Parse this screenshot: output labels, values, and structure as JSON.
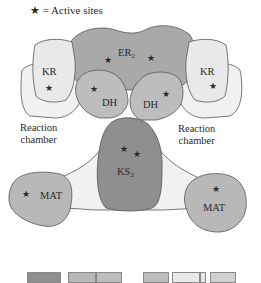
{
  "legend": {
    "symbol": "★",
    "text": "= Active sites"
  },
  "domains": {
    "er": {
      "name": "ER",
      "sub": "2",
      "color": "#a9a9a9"
    },
    "kr_left": {
      "name": "KR",
      "color": "#e9e9e9"
    },
    "kr_right": {
      "name": "KR",
      "color": "#e9e9e9"
    },
    "dh_left": {
      "name": "DH",
      "color": "#bdbdbd"
    },
    "dh_right": {
      "name": "DH",
      "color": "#bdbdbd"
    },
    "ks": {
      "name": "KS",
      "sub": "2",
      "color": "#8f8f8f"
    },
    "mat_left": {
      "name": "MAT",
      "color": "#b8b8b8"
    },
    "mat_right": {
      "name": "MAT",
      "color": "#b8b8b8"
    },
    "linker": {
      "color": "#f1f1f1"
    }
  },
  "labels": {
    "chamber_left": [
      "Reaction",
      "chamber"
    ],
    "chamber_right": [
      "Reaction",
      "chamber"
    ]
  },
  "star_symbol": "★",
  "linear_bar": {
    "segments": [
      {
        "x": 27,
        "w": 34,
        "color": "#8f8f8f"
      },
      {
        "x": 68,
        "w": 28,
        "color": "#b8b8b8"
      },
      {
        "x": 96,
        "w": 26,
        "color": "#bdbdbd"
      },
      {
        "x": 143,
        "w": 26,
        "color": "#bdbdbd"
      },
      {
        "x": 172,
        "w": 28,
        "color": "#e9e9e9"
      },
      {
        "x": 200,
        "w": 6,
        "color": "#e9e9e9"
      },
      {
        "x": 210,
        "w": 26,
        "color": "#d0d0d0"
      }
    ]
  }
}
